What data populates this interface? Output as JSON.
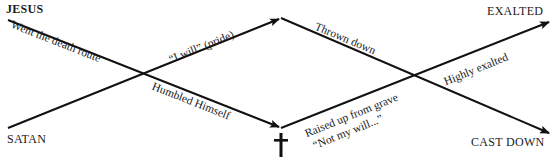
{
  "endpoints": {
    "jesus_start": "JESUS",
    "satan_start": "SATAN",
    "exalted_end": "EXALTED",
    "cast_down_end": "CAST DOWN"
  },
  "path_labels": {
    "went_death_route": "Went the death route",
    "i_will_pride": "“I will” (pride)",
    "thrown_down": "Thrown down",
    "humbled_himself": "Humbled Himself",
    "raised_up": "Raised up from grave",
    "not_my_will": "“Not my will...”",
    "highly_exalted": "Highly exalted"
  },
  "symbols": {
    "cross": "cross-icon"
  },
  "colors": {
    "line": "#111111",
    "text": "#1a1a1a",
    "background": "#ffffff"
  }
}
